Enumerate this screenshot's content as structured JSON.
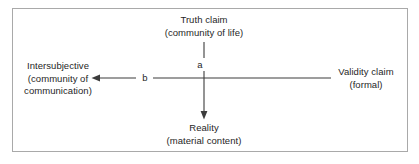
{
  "diagram": {
    "colors": {
      "text": "#262626",
      "border": "#a9a9a9",
      "connector": "#3c3c3c",
      "background": "#ffffff"
    },
    "nodes": {
      "truth_claim": {
        "line1": "Truth claim",
        "line2": "(community of life)"
      },
      "intersubjective": {
        "line1": "Intersubjective",
        "line2": "(community of",
        "line3": "communication)"
      },
      "validity_claim": {
        "line1": "Validity claim",
        "line2": "(formal)"
      },
      "reality": {
        "line1": "Reality",
        "line2": "(material content)"
      }
    },
    "edges": {
      "a": {
        "label": "a",
        "from": "truth_claim",
        "to": "reality",
        "direction": "down"
      },
      "b": {
        "label": "b",
        "from": "validity_claim",
        "to": "intersubjective",
        "direction": "left"
      }
    }
  }
}
